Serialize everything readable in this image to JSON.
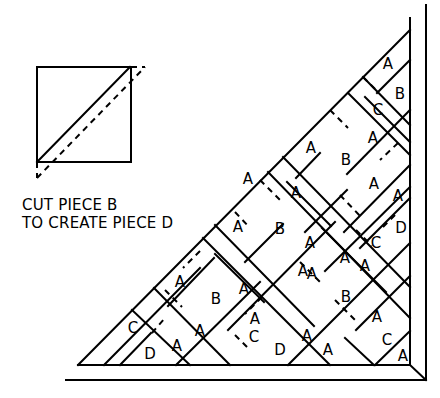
{
  "caption": {
    "line1": "CUT PIECE B",
    "line2": "TO CREATE PIECE D"
  },
  "pieces": {
    "A": "A",
    "B": "B",
    "C": "C",
    "D": "D"
  },
  "labels": [
    {
      "text": "A",
      "x": 388,
      "y": 64
    },
    {
      "text": "B",
      "x": 400,
      "y": 94
    },
    {
      "text": "C",
      "x": 378,
      "y": 110
    },
    {
      "text": "A",
      "x": 373,
      "y": 138
    },
    {
      "text": "A",
      "x": 311,
      "y": 148
    },
    {
      "text": "B",
      "x": 346,
      "y": 160
    },
    {
      "text": "A",
      "x": 374,
      "y": 184
    },
    {
      "text": "A",
      "x": 398,
      "y": 196
    },
    {
      "text": "D",
      "x": 401,
      "y": 228
    },
    {
      "text": "A",
      "x": 248,
      "y": 179
    },
    {
      "text": "B",
      "x": 280,
      "y": 229
    },
    {
      "text": "A",
      "x": 296,
      "y": 193
    },
    {
      "text": "A",
      "x": 310,
      "y": 243
    },
    {
      "text": "A",
      "x": 238,
      "y": 227
    },
    {
      "text": "C",
      "x": 376,
      "y": 243
    },
    {
      "text": "A",
      "x": 365,
      "y": 266
    },
    {
      "text": "B",
      "x": 346,
      "y": 297
    },
    {
      "text": "A",
      "x": 312,
      "y": 274
    },
    {
      "text": "A",
      "x": 377,
      "y": 317
    },
    {
      "text": "A",
      "x": 180,
      "y": 282
    },
    {
      "text": "B",
      "x": 216,
      "y": 299
    },
    {
      "text": "A",
      "x": 244,
      "y": 289
    },
    {
      "text": "A",
      "x": 255,
      "y": 319
    },
    {
      "text": "A",
      "x": 200,
      "y": 331
    },
    {
      "text": "A",
      "x": 177,
      "y": 346
    },
    {
      "text": "C",
      "x": 254,
      "y": 337
    },
    {
      "text": "D",
      "x": 280,
      "y": 350
    },
    {
      "text": "A",
      "x": 307,
      "y": 336
    },
    {
      "text": "A",
      "x": 328,
      "y": 350
    },
    {
      "text": "C",
      "x": 133,
      "y": 328
    },
    {
      "text": "D",
      "x": 150,
      "y": 354
    },
    {
      "text": "A",
      "x": 303,
      "y": 271
    },
    {
      "text": "A",
      "x": 345,
      "y": 258
    },
    {
      "text": "C",
      "x": 387,
      "y": 340
    },
    {
      "text": "A",
      "x": 403,
      "y": 356
    }
  ]
}
